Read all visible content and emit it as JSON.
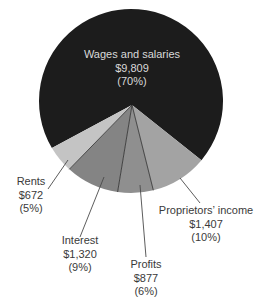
{
  "chart_data": {
    "type": "pie",
    "title": "",
    "units": "$",
    "slices": [
      {
        "label": "Wages and salaries",
        "value": 9809,
        "value_text": "$9,809",
        "percent": 70,
        "percent_text": "(70%)",
        "color": "#1c1c1c"
      },
      {
        "label": "Proprietors' income",
        "value": 1407,
        "value_text": "$1,407",
        "percent": 10,
        "percent_text": "(10%)",
        "color": "#a3a3a3"
      },
      {
        "label": "Profits",
        "value": 877,
        "value_text": "$877",
        "percent": 6,
        "percent_text": "(6%)",
        "color": "#8f8f8f"
      },
      {
        "label": "Interest",
        "value": 1320,
        "value_text": "$1,320",
        "percent": 9,
        "percent_text": "(9%)",
        "color": "#848484"
      },
      {
        "label": "Rents",
        "value": 672,
        "value_text": "$672",
        "percent": 5,
        "percent_text": "(5%)",
        "color": "#c4c4c4"
      }
    ],
    "legend": "none (direct labels with leader lines)"
  },
  "labels": {
    "wages": {
      "name": "Wages and salaries",
      "value": "$9,809",
      "pct": "(70%)"
    },
    "proprietors": {
      "name": "Proprietors’ income",
      "value": "$1,407",
      "pct": "(10%)"
    },
    "profits": {
      "name": "Profits",
      "value": "$877",
      "pct": "(6%)"
    },
    "interest": {
      "name": "Interest",
      "value": "$1,320",
      "pct": "(9%)"
    },
    "rents": {
      "name": "Rents",
      "value": "$672",
      "pct": "(5%)"
    }
  }
}
